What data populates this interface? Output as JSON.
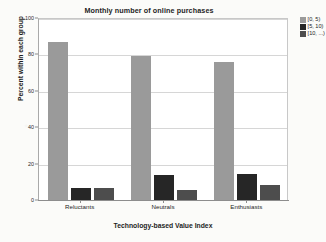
{
  "chart_data": {
    "type": "bar",
    "title": "Monthly number of online purchases",
    "xlabel": "Technology-based Value Index",
    "ylabel": "Percent within each group",
    "categories": [
      "Reluctants",
      "Neutrals",
      "Enthusiasts"
    ],
    "series": [
      {
        "name": "[0, 5)",
        "color": "#9a9a9a",
        "values": [
          87,
          79,
          76
        ]
      },
      {
        "name": "[5, 10)",
        "color": "#262626",
        "values": [
          6.5,
          14,
          14.5
        ]
      },
      {
        "name": "[10, ...)",
        "color": "#4d4d4d",
        "values": [
          6.5,
          5.5,
          8.5
        ]
      }
    ],
    "ylim": [
      0,
      100
    ],
    "yticks": [
      0,
      20,
      40,
      60,
      80,
      100
    ],
    "ytick_labels": [
      "0",
      "20",
      "40",
      "60",
      "80",
      "100"
    ],
    "grid": "horizontal",
    "legend_position": "top-right",
    "background": "#ffffff"
  }
}
